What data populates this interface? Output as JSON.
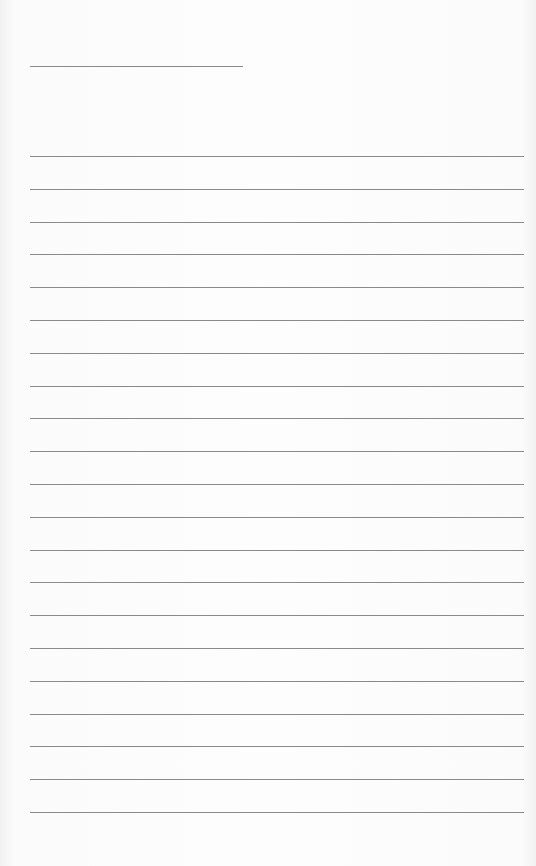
{
  "document": {
    "type": "lined-paper",
    "title_line": {
      "left": 30,
      "top": 66,
      "width": 213
    },
    "ruled_lines": {
      "count": 21,
      "left": 30,
      "width": 494,
      "first_top": 156,
      "spacing": 32.8
    },
    "colors": {
      "background": "#fdfdfd",
      "line": "#8a8a8a"
    }
  }
}
